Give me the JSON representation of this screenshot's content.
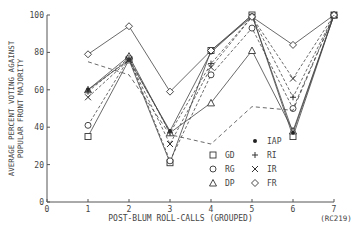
{
  "chart_data": {
    "type": "line",
    "title": "",
    "xlabel": "POST-BLUM ROLL-CALLS (GROUPED)",
    "ylabel": "AVERAGE PERCENT VOTING AGAINST POPULAR FRONT MAJORITY",
    "ylabel_lines": [
      "AVERAGE PERCENT VOTING AGAINST",
      "POPULAR FRONT MAJORITY"
    ],
    "x": [
      1,
      2,
      3,
      4,
      5,
      6,
      7
    ],
    "x_ticks": [
      "0",
      "1",
      "2",
      "3",
      "4",
      "5",
      "6",
      "7"
    ],
    "y_ticks": [
      "0",
      "20",
      "40",
      "60",
      "80",
      "100"
    ],
    "xlim": [
      0,
      7
    ],
    "ylim": [
      0,
      100
    ],
    "annotation": "(RC219)",
    "grid": false,
    "legend_position": "lower right inside",
    "series": [
      {
        "name": "GD",
        "marker": "square",
        "values": [
          35,
          76,
          21,
          81,
          100,
          35,
          100
        ]
      },
      {
        "name": "RG",
        "marker": "circle",
        "values": [
          41,
          77,
          22,
          68,
          93,
          50,
          100
        ]
      },
      {
        "name": "DP",
        "marker": "triangle",
        "values": [
          60,
          78,
          37,
          53,
          81,
          38,
          100
        ]
      },
      {
        "name": "IAP",
        "marker": "dot",
        "values": [
          60,
          76,
          38,
          80,
          100,
          37,
          100
        ]
      },
      {
        "name": "RI",
        "marker": "plus",
        "values": [
          59,
          77,
          37,
          74,
          99,
          56,
          100
        ]
      },
      {
        "name": "IR",
        "marker": "x",
        "values": [
          56,
          76,
          31,
          72,
          99,
          66,
          100
        ]
      },
      {
        "name": "FR",
        "marker": "diamond",
        "values": [
          79,
          94,
          59,
          81,
          99,
          84,
          100
        ]
      },
      {
        "name": "unmarked (dashed)",
        "marker": "none",
        "values": [
          75,
          68,
          36,
          31,
          51,
          49,
          100
        ]
      }
    ]
  },
  "legend": [
    {
      "symbol": "□",
      "label": "GD"
    },
    {
      "symbol": "○",
      "label": "RG"
    },
    {
      "symbol": "△",
      "label": "DP"
    },
    {
      "symbol": "•",
      "label": "IAP"
    },
    {
      "symbol": "+",
      "label": "RI"
    },
    {
      "symbol": "×",
      "label": "IR"
    },
    {
      "symbol": "◇",
      "label": "FR"
    }
  ]
}
